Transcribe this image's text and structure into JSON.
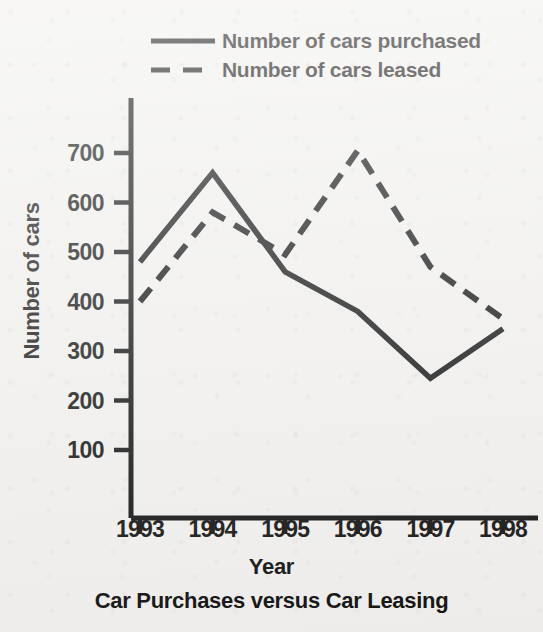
{
  "chart_data": {
    "type": "line",
    "title": "Car Purchases versus Car Leasing",
    "xlabel": "Year",
    "ylabel": "Number of cars",
    "categories": [
      "1993",
      "1994",
      "1995",
      "1996",
      "1997",
      "1998"
    ],
    "x": [
      1993,
      1994,
      1995,
      1996,
      1997,
      1998
    ],
    "series": [
      {
        "name": "Number of cars purchased",
        "style": "solid",
        "color": "#111111",
        "values": [
          480,
          660,
          460,
          380,
          245,
          345
        ]
      },
      {
        "name": "Number of cars leased",
        "style": "dashed",
        "color": "#111111",
        "values": [
          400,
          580,
          495,
          705,
          470,
          365
        ]
      }
    ],
    "ylim": [
      100,
      700
    ],
    "yticks": [
      700,
      600,
      500,
      400,
      300,
      200,
      100
    ],
    "ytick_labels": [
      "700",
      "600",
      "500",
      "400",
      "300",
      "200",
      "100"
    ],
    "xtick_labels": [
      "1993",
      "1994",
      "1995",
      "1996",
      "1997",
      "1998"
    ],
    "grid": false,
    "legend_position": "top-center"
  },
  "legend": {
    "items": [
      {
        "label": "Number of cars purchased",
        "style": "solid"
      },
      {
        "label": "Number of cars leased",
        "style": "dashed"
      }
    ]
  },
  "axes": {
    "ylabel": "Number of cars",
    "xlabel": "Year"
  },
  "caption": "Car Purchases versus Car Leasing",
  "colors": {
    "background": "#f1f0ee",
    "ink": "#111111"
  }
}
